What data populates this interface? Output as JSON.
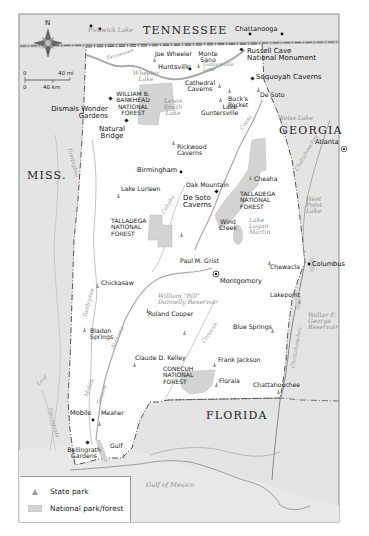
{
  "map": {
    "states": {
      "tennessee": "TENNESSEE",
      "georgia": "GEORGIA",
      "mississippi": "MISS.",
      "florida": "FLORIDA"
    },
    "compass": {
      "north_label": "N"
    },
    "scale_bar": {
      "miles_start": "0",
      "miles_end": "40 mi",
      "km_start": "0",
      "km_end": "40 km"
    },
    "water_bodies": {
      "pickwick_lake": "Pickwick Lake",
      "wheeler_lake": "Wheeler Lake",
      "lewis_smith_lake": "Lewis Smith Lake",
      "guntersville_lake": "Guntersville Lake",
      "weiss_lake": "Weiss Lake",
      "west_point_lake": "West Point Lake",
      "lake_logan_martin": "Lake Logan Martin",
      "dannelly_reservoir": "William \"Bill\" Dannelly Reservoir",
      "walter_george_reservoir": "Walter F. George Reservoir",
      "gulf_of_mexico": "Gulf of Mexico"
    },
    "rivers": {
      "tennessee": "Tennessee",
      "tombigbee_n": "Tombigbee",
      "tombigbee_s": "Tombigbee",
      "cahaba": "Cahaba",
      "coosa": "Coosa",
      "alabama": "Alabama",
      "conecuh": "Conecuh",
      "chattahoochee_n": "Chattahoochee",
      "chattahoochee_s": "Chattahoochee",
      "mobile": "Mobile",
      "tensaw": "Tensaw",
      "leaf": "Leaf",
      "pascagoula": "Pascagoula"
    },
    "cities": {
      "chattanooga": "Chattanooga",
      "huntsville": "Huntsville",
      "birmingham": "Birmingham",
      "atlanta": "Atlanta",
      "montgomery": "Montgomery",
      "columbus": "Columbus",
      "mobile": "Mobile"
    },
    "national_sites": {
      "russell_cave": "Russell Cave National Monument",
      "sequoyah_caverns": "Sequoyah Caverns",
      "dismals": "Dismals Wonder Gardens",
      "natural_bridge": "Natural Bridge",
      "de_soto_caverns": "De Soto Caverns",
      "oak_mountain": "Oak Mountain",
      "bellingrath": "Bellingrath Gardens"
    },
    "forests": {
      "bankhead": "WILLIAM B. BANKHEAD NATIONAL FOREST",
      "talladega_north": "TALLADEGA NATIONAL FOREST",
      "talladega_south": "TALLADEGA NATIONAL FOREST",
      "conecuh": "CONECUH NATIONAL FOREST"
    },
    "state_parks": {
      "joe_wheeler": "Joe Wheeler",
      "monte_sano": "Monte Sano",
      "cathedral_caverns": "Cathedral Caverns",
      "bucks_pocket": "Buck's Pocket",
      "lake_guntersville": "Lake Guntersville",
      "de_soto": "De Soto",
      "rickwood_caverns": "Rickwood Caverns",
      "lake_lurleen": "Lake Lurleen",
      "cheaha": "Cheaha",
      "wind_creek": "Wind Creek",
      "paul_m_grist": "Paul M. Grist",
      "chewacla": "Chewacla",
      "chickasaw": "Chickasaw",
      "roland_cooper": "Roland Cooper",
      "lakepoint": "Lakepoint",
      "bladon_springs": "Bladon Springs",
      "blue_springs": "Blue Springs",
      "claude_d_kelley": "Claude D. Kelley",
      "frank_jackson": "Frank Jackson",
      "florala": "Florala",
      "chattahoochee": "Chattahoochee",
      "meaher": "Meaher",
      "gulf": "Gulf"
    },
    "colors": {
      "neighbor_land": "#e4e4e4",
      "state_land": "#ffffff",
      "forest_fill": "#d3d3d3",
      "water": "#c8c8c8",
      "border_line": "#555555",
      "park_icon": "#9a9a9a"
    }
  },
  "legend": {
    "state_park": "State park",
    "national_park_forest": "National park/forest"
  }
}
